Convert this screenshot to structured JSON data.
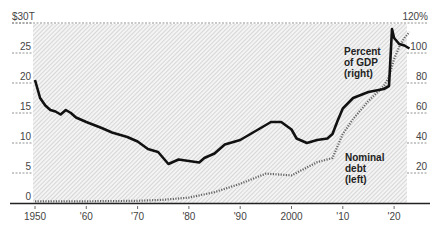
{
  "chart_data": {
    "type": "line",
    "title": "",
    "xlabel": "",
    "x_ticks": [
      "1950",
      "'60",
      "'70",
      "'80",
      "'90",
      "2000",
      "'10",
      "'20"
    ],
    "x_tick_years": [
      1950,
      1960,
      1970,
      1980,
      1990,
      2000,
      2010,
      2020
    ],
    "left_axis": {
      "ylabel": "Nominal debt",
      "ylim": [
        0,
        30
      ],
      "ticks": [
        0,
        5,
        10,
        15,
        20,
        25,
        30
      ],
      "tick_labels": [
        "0",
        "5",
        "10",
        "15",
        "20",
        "25",
        "$30T"
      ]
    },
    "right_axis": {
      "ylabel": "Percent of GDP",
      "ylim": [
        0,
        120
      ],
      "ticks": [
        20,
        40,
        60,
        80,
        100,
        120
      ],
      "tick_labels": [
        "20",
        "40",
        "60",
        "80",
        "100",
        "120%"
      ]
    },
    "grid": true,
    "legend": "inline annotations",
    "series": [
      {
        "name": "Percent of GDP (right)",
        "axis": "right",
        "style": "solid",
        "color": "#111111",
        "x": [
          1950,
          1951,
          1952,
          1953,
          1954,
          1955,
          1956,
          1957,
          1958,
          1960,
          1963,
          1965,
          1968,
          1970,
          1972,
          1974,
          1976,
          1978,
          1980,
          1982,
          1983,
          1985,
          1987,
          1990,
          1993,
          1996,
          1998,
          2000,
          2001,
          2003,
          2005,
          2007,
          2008,
          2009,
          2010,
          2012,
          2015,
          2018,
          2019,
          2019.6,
          2020,
          2021,
          2022,
          2023
        ],
        "values": [
          82,
          70,
          65,
          62,
          61,
          59,
          62,
          60,
          57,
          54,
          50,
          47,
          44,
          41,
          36,
          34,
          26,
          29,
          28,
          27,
          30,
          33,
          39,
          42,
          48,
          54,
          54,
          49,
          43,
          40,
          42,
          43,
          46,
          55,
          63,
          70,
          74,
          76,
          78,
          116,
          110,
          106,
          105,
          103
        ]
      },
      {
        "name": "Nominal debt (left)",
        "axis": "left",
        "style": "dotted",
        "color": "#555555",
        "x": [
          1950,
          1955,
          1960,
          1965,
          1970,
          1975,
          1980,
          1985,
          1990,
          1995,
          2000,
          2005,
          2008,
          2010,
          2012,
          2015,
          2018,
          2019,
          2020,
          2021,
          2022,
          2023
        ],
        "values": [
          0.26,
          0.27,
          0.29,
          0.32,
          0.37,
          0.53,
          0.9,
          1.8,
          3.2,
          4.9,
          4.6,
          6.8,
          7.5,
          11.5,
          14.0,
          17.0,
          19.5,
          21.0,
          24.0,
          26.0,
          27.5,
          28.5
        ]
      }
    ],
    "annotations": [
      {
        "text_lines": [
          "Percent",
          "of GDP",
          "(right)"
        ]
      },
      {
        "text_lines": [
          "Nominal",
          "debt",
          "(left)"
        ]
      }
    ],
    "colors": {
      "background_hatch": "#d4d4d4",
      "axis_line": "#222222",
      "gridline": "#888888"
    }
  }
}
